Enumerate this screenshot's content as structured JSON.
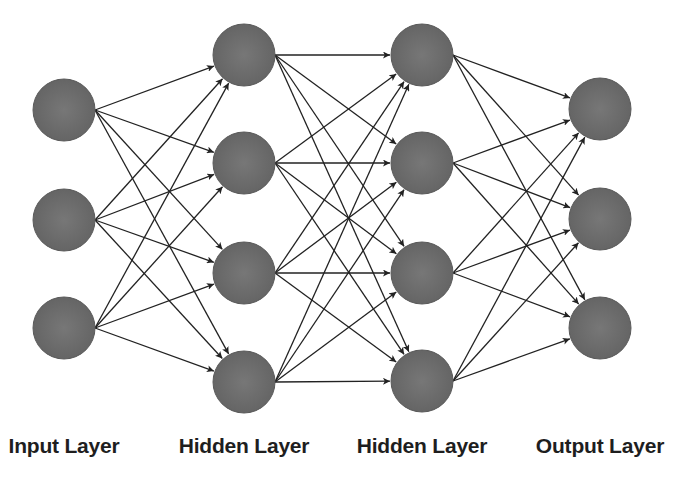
{
  "diagram": {
    "colors": {
      "background": "#ffffff",
      "node_fill": "#6e6e6e",
      "node_stroke": "#5a5a5a",
      "edge": "#222222",
      "label": "#1e1e1e"
    },
    "node_radius": 31,
    "layers": [
      {
        "id": "input",
        "label": "Input Layer",
        "x": 64,
        "label_x": 64,
        "nodes": [
          110,
          220,
          328
        ]
      },
      {
        "id": "hidden1",
        "label": "Hidden Layer",
        "x": 244,
        "label_x": 244,
        "nodes": [
          55,
          163,
          273,
          382
        ]
      },
      {
        "id": "hidden2",
        "label": "Hidden Layer",
        "x": 422,
        "label_x": 422,
        "nodes": [
          55,
          163,
          273,
          381
        ]
      },
      {
        "id": "output",
        "label": "Output Layer",
        "x": 600,
        "label_x": 600,
        "nodes": [
          109,
          219,
          328
        ]
      }
    ],
    "connections": "fully-connected between consecutive layers, directed left to right with arrowheads"
  }
}
